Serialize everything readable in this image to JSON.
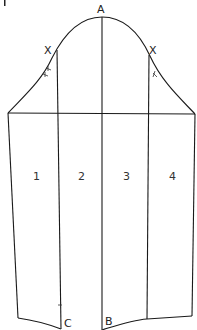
{
  "diagram": {
    "figure_marker": "I",
    "points": [
      {
        "id": "A",
        "label": "A",
        "x": 101,
        "y": 10
      },
      {
        "id": "X_left",
        "label": "X",
        "x": 48,
        "y": 50
      },
      {
        "id": "X_right",
        "label": "X",
        "x": 153,
        "y": 50
      },
      {
        "id": "C",
        "label": "C",
        "x": 67,
        "y": 326
      },
      {
        "id": "B",
        "label": "B",
        "x": 109,
        "y": 324
      }
    ],
    "sections": [
      {
        "id": "1",
        "label": "1"
      },
      {
        "id": "2",
        "label": "2"
      },
      {
        "id": "3",
        "label": "3"
      },
      {
        "id": "4",
        "label": "4"
      }
    ],
    "colors": {
      "line": "#1a1a1a",
      "background": "#ffffff"
    }
  }
}
